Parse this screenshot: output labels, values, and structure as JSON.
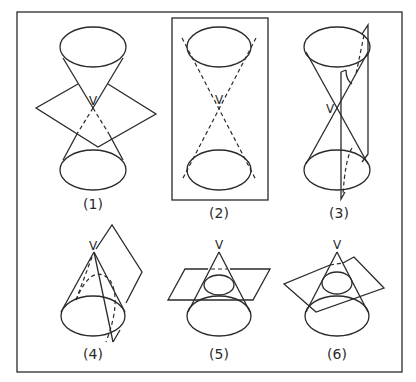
{
  "figure": {
    "vertex_label": "V",
    "panels": [
      {
        "id": 1,
        "label": "(1)",
        "vertex": "V"
      },
      {
        "id": 2,
        "label": "(2)",
        "vertex": "V"
      },
      {
        "id": 3,
        "label": "(3)",
        "vertex": "V"
      },
      {
        "id": 4,
        "label": "(4)",
        "vertex": "V"
      },
      {
        "id": 5,
        "label": "(5)",
        "vertex": "V"
      },
      {
        "id": 6,
        "label": "(6)",
        "vertex": "V"
      }
    ]
  },
  "colors": {
    "stroke": "#2a2a2a",
    "background": "#ffffff"
  }
}
